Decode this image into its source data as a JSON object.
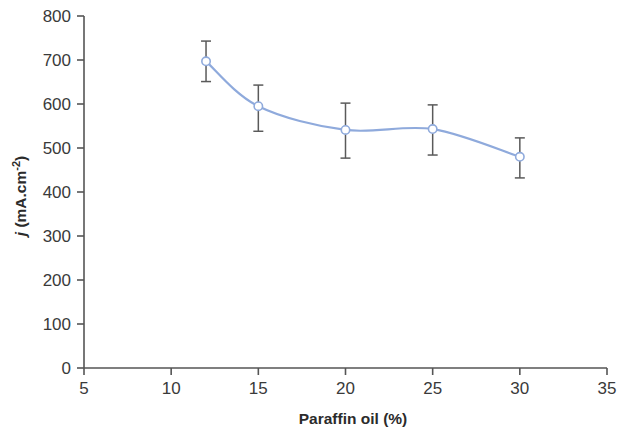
{
  "chart_data": {
    "type": "line",
    "title": "",
    "xlabel": "Paraffin oil (%)",
    "ylabel": "j (mA.cm-2)",
    "ylabel_parts": {
      "italic": "j",
      "rest": " (mA.cm",
      "superscript": "-2",
      "tail": ")"
    },
    "x": [
      12,
      15,
      20,
      25,
      30
    ],
    "values": [
      697,
      595,
      541,
      543,
      480
    ],
    "error_upper": [
      46,
      48,
      61,
      55,
      43
    ],
    "error_lower": [
      46,
      57,
      64,
      59,
      48
    ],
    "xlim": [
      5,
      35
    ],
    "ylim": [
      0,
      800
    ],
    "xticks": [
      "5",
      "10",
      "15",
      "20",
      "25",
      "30",
      "35"
    ],
    "xtick_values": [
      5,
      10,
      15,
      20,
      25,
      30,
      35
    ],
    "yticks": [
      "0",
      "100",
      "200",
      "300",
      "400",
      "500",
      "600",
      "700",
      "800"
    ],
    "ytick_values": [
      0,
      100,
      200,
      300,
      400,
      500,
      600,
      700,
      800
    ],
    "grid": false,
    "legend": false,
    "marker": "open-circle",
    "series_color": "#8faadc",
    "marker_fill": "#ffffff",
    "errorbar_color": "#5a5a5a",
    "axis_color": "#555555",
    "text_color": "#3a3a3a",
    "background": "#ffffff"
  }
}
